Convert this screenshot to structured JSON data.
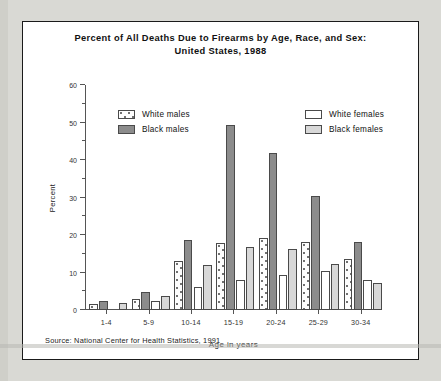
{
  "chart_data": {
    "type": "bar",
    "title": "Percent of All Deaths Due to Firearms by Age, Race, and Sex:",
    "subtitle": "United States, 1988",
    "xlabel": "Age in years",
    "ylabel": "Percent",
    "ylim": [
      0,
      60
    ],
    "ytick_step": 10,
    "yminor_step": 5,
    "grid": false,
    "legend_position": "inside-top",
    "categories": [
      "1-4",
      "5-9",
      "10-14",
      "15-19",
      "20-24",
      "25-29",
      "30-34"
    ],
    "series": [
      {
        "name": "White males",
        "color": "#fdfdfd",
        "pattern": "dotted",
        "values": [
          1.7,
          3.0,
          13.0,
          18.0,
          19.3,
          18.2,
          13.5
        ]
      },
      {
        "name": "Black males",
        "color": "#8c8c8c",
        "pattern": "solid-gray",
        "values": [
          2.5,
          4.7,
          18.6,
          49.4,
          41.8,
          30.3,
          18.2
        ]
      },
      {
        "name": "White females",
        "color": "#ffffff",
        "pattern": "white",
        "values": [
          0.0,
          2.5,
          6.1,
          7.9,
          9.4,
          10.5,
          7.9
        ]
      },
      {
        "name": "Black females",
        "color": "#d8d8d8",
        "pattern": "light-gray",
        "values": [
          1.9,
          3.8,
          12.1,
          16.8,
          16.2,
          12.4,
          7.3
        ]
      }
    ],
    "ytick_labels": [
      "0",
      "10",
      "20",
      "30",
      "40",
      "50",
      "60"
    ],
    "source": "Source: National Center for Health Statistics, 1991"
  },
  "legend": {
    "left": [
      {
        "label": "White males",
        "swatch": "white-dotted-swatch"
      },
      {
        "label": "Black males",
        "swatch": "dark-gray-swatch"
      }
    ],
    "right": [
      {
        "label": "White females",
        "swatch": "white-swatch"
      },
      {
        "label": "Black females",
        "swatch": "light-gray-swatch"
      }
    ]
  }
}
